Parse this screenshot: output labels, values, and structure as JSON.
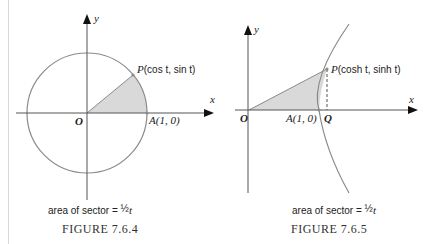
{
  "figures": [
    {
      "id": "figure-7-6-4",
      "title": "Figure 7.6.4",
      "title_display": "FIGURE 7.6.4",
      "caption_prefix": "area of sector = ",
      "caption_fraction": "1/2",
      "caption_var": "t",
      "axis_x_label": "x",
      "axis_y_label": "y",
      "origin_label": "O",
      "point_A_label": "A(1, 0)",
      "point_P_label_prefix": "P",
      "point_P_label_coords": "(cos t, sin t)",
      "curve": "unit circle",
      "colors": {
        "curve": "#8a8a8a",
        "fill": "#d9d9d9",
        "axis": "#555555",
        "arrow": "#111111"
      }
    },
    {
      "id": "figure-7-6-5",
      "title": "Figure 7.6.5",
      "title_display": "FIGURE 7.6.5",
      "caption_prefix": "area of sector = ",
      "caption_fraction": "1/2",
      "caption_var": "t",
      "axis_x_label": "x",
      "axis_y_label": "y",
      "origin_label": "O",
      "point_A_label": "A(1, 0)",
      "point_Q_label": "Q",
      "point_P_label_prefix": "P",
      "point_P_label_coords": "(cosh t, sinh t)",
      "curve": "unit hyperbola right branch",
      "colors": {
        "curve": "#8a8a8a",
        "fill": "#d9d9d9",
        "axis": "#555555",
        "arrow": "#111111"
      }
    }
  ]
}
